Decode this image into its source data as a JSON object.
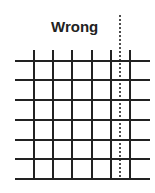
{
  "diagram": {
    "title": "Wrong",
    "grid": {
      "horizontal_lines_y": [
        61,
        80,
        100,
        120,
        140,
        159,
        179
      ],
      "horizontal_x_range": [
        15,
        150
      ],
      "vertical_lines_x": [
        34,
        53,
        72,
        92,
        111,
        130
      ],
      "vertical_y_range": [
        50,
        179
      ],
      "line_color": "#222222"
    },
    "dashed_line": {
      "x": 120,
      "y_range": [
        15,
        178
      ],
      "color": "#222222"
    }
  }
}
